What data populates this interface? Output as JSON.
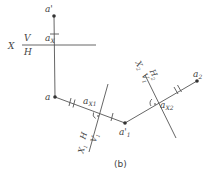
{
  "diagram": {
    "caption": "(b)",
    "points": {
      "a_prime": {
        "label": "a'",
        "sub": ""
      },
      "a": {
        "label": "a",
        "sub": ""
      },
      "a1_prime": {
        "label": "a'",
        "sub": "1"
      },
      "a2": {
        "label": "a",
        "sub": "2"
      }
    },
    "axis_points": {
      "ax": {
        "label": "a",
        "sub": "X"
      },
      "ax1": {
        "label": "a",
        "sub": "X1"
      },
      "ax2": {
        "label": "a",
        "sub": "X2"
      }
    },
    "axes": {
      "x": {
        "name": "X",
        "top": "V",
        "bottom": "H"
      },
      "x1": {
        "name": "X",
        "name_sub": "1",
        "left": "H",
        "right": "V",
        "right_sub": "1"
      },
      "x2": {
        "name": "X",
        "name_sub": "2",
        "left": "V",
        "left_sub": "1",
        "right": "H",
        "right_sub": "2"
      }
    },
    "colors": {
      "line": "#555555",
      "point": "#333333",
      "text": "#444444"
    }
  }
}
